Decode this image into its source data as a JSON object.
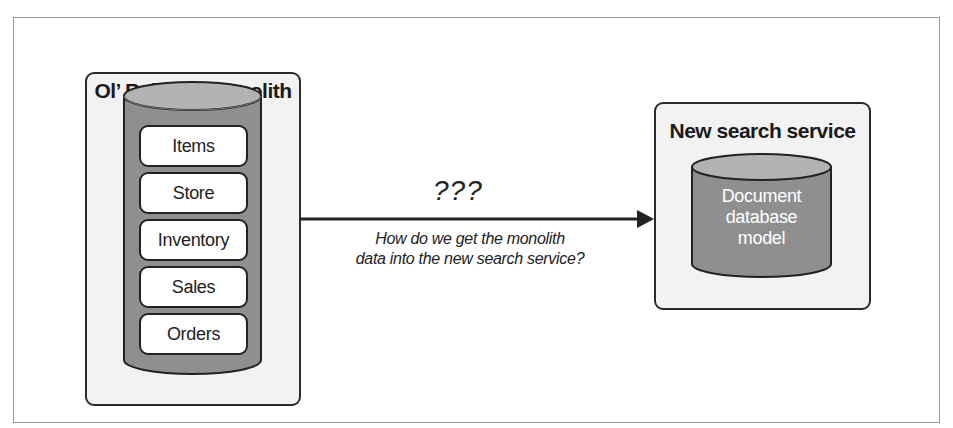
{
  "colors": {
    "panel_bg": "#f2f2f2",
    "cylinder_body": "#8f8f8f",
    "cylinder_top": "#b3b3b3",
    "outline": "#222222",
    "item_bg": "#ffffff"
  },
  "monolith": {
    "title": "Ol’ Reliable monolith",
    "items": [
      {
        "label": "Items"
      },
      {
        "label": "Store"
      },
      {
        "label": "Inventory"
      },
      {
        "label": "Sales"
      },
      {
        "label": "Orders"
      }
    ]
  },
  "connector": {
    "label": "???",
    "caption_line1": "How do we get the monolith",
    "caption_line2": "data into the new search service?"
  },
  "search_service": {
    "title": "New search service",
    "database": {
      "line1": "Document",
      "line2": "database",
      "line3": "model"
    }
  }
}
